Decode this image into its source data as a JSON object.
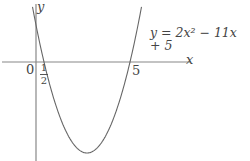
{
  "chart_data": {
    "type": "line",
    "title": "",
    "equation": "y = 2x² − 11x + 5",
    "xlabel": "x",
    "ylabel": "y",
    "origin_label": "0",
    "x_intercepts": [
      0.5,
      5
    ],
    "x_intercept_labels": [
      "1/2",
      "5"
    ],
    "y_intercept": 5,
    "vertex": [
      2.75,
      -10.125
    ],
    "coefficients": {
      "a": 2,
      "b": -11,
      "c": 5
    },
    "grid": false,
    "line_color": "#666666",
    "axis_color": "#888888"
  },
  "labels": {
    "y_axis": "y",
    "x_axis": "x",
    "origin": "0",
    "half_num": "1",
    "half_den": "2",
    "five": "5",
    "equation": "y = 2x² − 11x + 5"
  }
}
